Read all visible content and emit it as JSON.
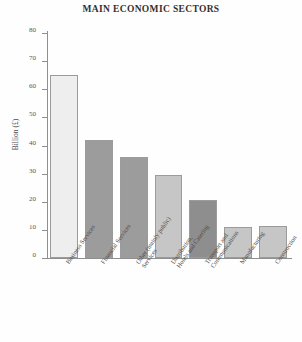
{
  "chart_data": {
    "type": "bar",
    "title": "MAIN ECONOMIC SECTORS",
    "xlabel": "",
    "ylabel": "Billion (£)",
    "ylim": [
      0,
      80
    ],
    "yticks": [
      0,
      10,
      20,
      30,
      40,
      50,
      60,
      70,
      80
    ],
    "grid": false,
    "legend": "none",
    "categories": [
      "Business Services",
      "Financial Services",
      "Other (mainly public) Services",
      "Distribution, Hotels and Catering",
      "Transport and Communications",
      "Manufacturing",
      "Construction"
    ],
    "category_lines": [
      [
        "Business Services"
      ],
      [
        "Financial Services"
      ],
      [
        "Other (mainly public)",
        "Services"
      ],
      [
        "Distribution,",
        "Hotels and Catering"
      ],
      [
        "Transport and",
        "Communications"
      ],
      [
        "Manufacturing"
      ],
      [
        "Construction"
      ]
    ],
    "values": [
      65,
      42,
      36,
      29.5,
      20.5,
      11,
      11.5
    ],
    "bar_colors": [
      "#eeeeee",
      "#9c9c9c",
      "#9c9c9c",
      "#c6c6c6",
      "#8e8e8e",
      "#c6c6c6",
      "#c6c6c6"
    ],
    "bar_edge_color": "#9b9b9b",
    "axis_color": "#8f8f8f",
    "text_color": "#4f4b49",
    "background": "#fefefe"
  }
}
